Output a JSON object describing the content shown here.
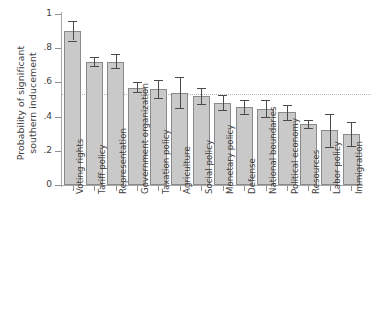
{
  "chart_data": {
    "type": "bar",
    "title": "",
    "xlabel": "",
    "ylabel_lines": [
      "Probability of significant",
      "southern inducement"
    ],
    "ylabel": "Probability of significant southern inducement",
    "ylim": [
      0,
      1
    ],
    "yticks": [
      0,
      0.2,
      0.4,
      0.6,
      0.8,
      1
    ],
    "ytick_labels": [
      "0",
      ".2",
      ".4",
      ".6",
      ".8",
      "1"
    ],
    "grid": false,
    "legend": null,
    "reference_line": {
      "value": 0.535,
      "style": "dotted",
      "color": "#b6b6b6",
      "orientation": "horizontal"
    },
    "error_bar_type": "95% confidence interval",
    "bar_fill_color": "#c9c9c9",
    "bar_border_color": "#8a8a8a",
    "error_bar_color": "#4a4a4a",
    "categories": [
      "Voting rights",
      "Tariff policy",
      "Representation",
      "Government organization",
      "Taxation policy",
      "Agriculture",
      "Social policy",
      "Monetary policy",
      "Defense",
      "National boundaries",
      "Political economy",
      "Resources",
      "Labor policy",
      "Immigration"
    ],
    "values": [
      0.9,
      0.72,
      0.72,
      0.57,
      0.56,
      0.54,
      0.52,
      0.48,
      0.455,
      0.445,
      0.425,
      0.355,
      0.32,
      0.3
    ],
    "err_low": [
      0.845,
      0.695,
      0.685,
      0.545,
      0.51,
      0.45,
      0.475,
      0.44,
      0.415,
      0.395,
      0.38,
      0.335,
      0.225,
      0.23
    ],
    "err_high": [
      0.96,
      0.75,
      0.765,
      0.6,
      0.615,
      0.63,
      0.565,
      0.525,
      0.5,
      0.5,
      0.47,
      0.38,
      0.415,
      0.37
    ]
  }
}
